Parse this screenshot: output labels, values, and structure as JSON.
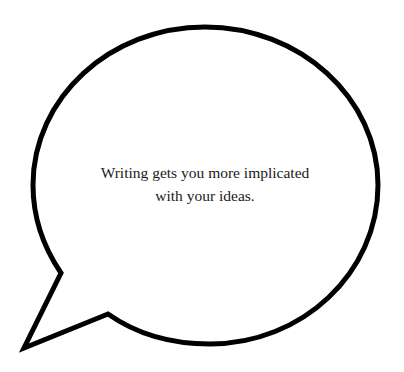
{
  "speech_bubble": {
    "text_lines": [
      "Writing gets you more implicated",
      "with your ideas."
    ],
    "stroke_color": "#000000",
    "fill_color": "#ffffff",
    "tail_direction": "bottom-left"
  }
}
